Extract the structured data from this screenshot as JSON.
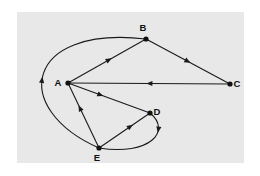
{
  "figure": {
    "kind": "directed-graph-diagram",
    "background_color": "#ffffff",
    "panel_color": "#e8e8e8",
    "ink_color": "#1a1a1a"
  },
  "graph": {
    "directed": true,
    "vertices": [
      {
        "id": "A",
        "label": "A",
        "x": 68,
        "y": 83,
        "label_dx": -10,
        "label_dy": 3
      },
      {
        "id": "B",
        "label": "B",
        "x": 146,
        "y": 39,
        "label_dx": -3,
        "label_dy": -8
      },
      {
        "id": "C",
        "label": "C",
        "x": 230,
        "y": 84,
        "label_dx": 7,
        "label_dy": 3
      },
      {
        "id": "D",
        "label": "D",
        "x": 150,
        "y": 113,
        "label_dx": 7,
        "label_dy": 2
      },
      {
        "id": "E",
        "label": "E",
        "x": 99,
        "y": 148,
        "label_dx": -2,
        "label_dy": 13
      }
    ],
    "edges": [
      {
        "id": "A-B",
        "from": "A",
        "to": "B",
        "shape": "straight",
        "arrow_t": 0.53
      },
      {
        "id": "B-C",
        "from": "B",
        "to": "C",
        "shape": "straight",
        "arrow_t": 0.5
      },
      {
        "id": "C-A",
        "from": "C",
        "to": "A",
        "shape": "straight",
        "arrow_t": 0.5
      },
      {
        "id": "A-D",
        "from": "A",
        "to": "D",
        "shape": "straight",
        "arrow_t": 0.4
      },
      {
        "id": "E-A",
        "from": "E",
        "to": "A",
        "shape": "straight",
        "arrow_t": 0.62
      },
      {
        "id": "E-D",
        "from": "E",
        "to": "D",
        "shape": "straight",
        "arrow_t": 0.62
      },
      {
        "id": "D-E",
        "from": "D",
        "to": "E",
        "shape": "curved",
        "cx1": 172,
        "cy1": 131,
        "cx2": 150,
        "cy2": 156,
        "arrow_t": 0.3
      },
      {
        "id": "E-B",
        "from": "E",
        "to": "B",
        "shape": "curved",
        "cx1": 10,
        "cy1": 109,
        "cx2": 24,
        "cy2": 25,
        "arrow_t": 0.46
      }
    ]
  }
}
